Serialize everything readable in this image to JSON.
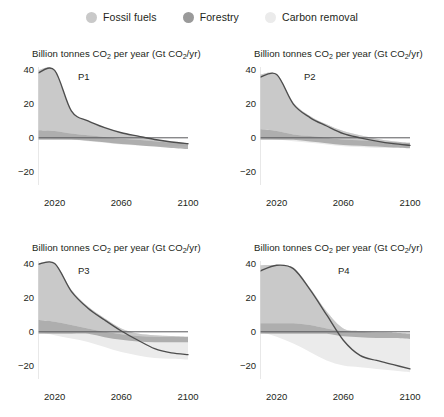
{
  "legend": {
    "items": [
      {
        "label": "Fossil fuels",
        "color": "#c9c9c9",
        "key": "fossil_fuels"
      },
      {
        "label": "Forestry",
        "color": "#9a9a9a",
        "key": "forestry"
      },
      {
        "label": "Carbon removal",
        "color": "#ebebeb",
        "key": "carbon_removal"
      }
    ]
  },
  "axis": {
    "y_ticks": [
      "40",
      "20",
      "0",
      "−20"
    ],
    "x_ticks": [
      "2020",
      "2060",
      "2100"
    ],
    "title": "Billion tonnes CO2 per year (Gt CO2/yr)",
    "title_prefix": "Billion tonnes CO",
    "title_mid": " per year (Gt CO",
    "title_suffix": "/yr)",
    "sub2": "2"
  },
  "colors": {
    "fossil_fuels": "#c9c9c9",
    "forestry": "#9a9a9a",
    "carbon_removal": "#ebebeb",
    "line": "#4d4d4d",
    "zero_line": "#58585a",
    "axis": "#d9d9d9",
    "text": "#231f20"
  },
  "chart_data": {
    "type": "area",
    "title": "Billion tonnes CO2 per year (Gt CO2/yr)",
    "xlabel": "",
    "ylabel": "Billion tonnes CO2 per year (Gt CO2/yr)",
    "xlim": [
      2010,
      2100
    ],
    "ylim": [
      -28,
      42
    ],
    "grid": false,
    "legend_position": "top-center",
    "x": [
      2010,
      2020,
      2030,
      2040,
      2050,
      2060,
      2070,
      2080,
      2090,
      2100
    ],
    "series_names": [
      "Fossil fuels",
      "Forestry",
      "Carbon removal",
      "Net CO2"
    ],
    "panels": [
      {
        "label": "P1",
        "net_emissions": [
          38.5,
          40.0,
          16.0,
          10.0,
          6.0,
          3.0,
          1.0,
          -1.0,
          -2.5,
          -3.5
        ],
        "fossil_fuels_band": [
          40.0,
          40.0,
          16.0,
          10.0,
          6.0,
          3.2,
          1.2,
          -0.8,
          -2.2,
          -3.2
        ],
        "forestry_band": [
          4.5,
          4.0,
          2.5,
          1.5,
          0.5,
          -0.5,
          -1.2,
          -2.0,
          -2.8,
          -3.5
        ],
        "carbon_removal_band": [
          0.0,
          -0.5,
          -1.0,
          -2.0,
          -3.0,
          -4.0,
          -4.5,
          -5.0,
          -5.0,
          -5.0
        ],
        "peak_year": 2020,
        "peak_value": 40.0,
        "value_2100": -3.5
      },
      {
        "label": "P2",
        "net_emissions": [
          36.0,
          37.5,
          20.0,
          12.0,
          7.0,
          2.5,
          0.0,
          -2.0,
          -3.5,
          -4.5
        ],
        "fossil_fuels_band": [
          37.5,
          37.5,
          21.0,
          13.0,
          8.0,
          4.0,
          1.5,
          -0.5,
          -2.0,
          -3.0
        ],
        "forestry_band": [
          5.0,
          4.0,
          2.0,
          1.0,
          0.0,
          -1.0,
          -1.5,
          -2.0,
          -2.5,
          -3.0
        ],
        "carbon_removal_band": [
          0.0,
          -1.0,
          -2.0,
          -3.0,
          -4.0,
          -5.0,
          -5.5,
          -6.0,
          -6.0,
          -6.0
        ],
        "peak_year": 2022,
        "peak_value": 37.5,
        "value_2100": -4.5
      },
      {
        "label": "P3",
        "net_emissions": [
          40.0,
          40.5,
          24.0,
          14.0,
          7.0,
          0.5,
          -5.0,
          -10.0,
          -12.5,
          -13.5
        ],
        "fossil_fuels_band": [
          40.5,
          40.5,
          25.0,
          15.0,
          8.0,
          2.0,
          -1.0,
          -2.0,
          -2.5,
          -3.0
        ],
        "forestry_band": [
          7.0,
          6.0,
          4.0,
          2.0,
          0.0,
          -1.5,
          -2.5,
          -3.0,
          -3.0,
          -3.0
        ],
        "carbon_removal_band": [
          0.0,
          -2.0,
          -4.0,
          -6.0,
          -9.0,
          -12.0,
          -14.0,
          -15.5,
          -16.0,
          -16.5
        ],
        "peak_year": 2022,
        "peak_value": 40.5,
        "value_2100": -13.5
      },
      {
        "label": "P4",
        "net_emissions": [
          36.0,
          39.5,
          37.5,
          25.0,
          10.0,
          -5.0,
          -14.0,
          -17.0,
          -19.5,
          -22.0
        ],
        "fossil_fuels_band": [
          39.5,
          39.5,
          38.0,
          26.0,
          12.0,
          2.0,
          0.5,
          0.0,
          -0.5,
          -1.0
        ],
        "forestry_band": [
          5.0,
          5.0,
          5.0,
          4.0,
          2.0,
          0.5,
          0.0,
          -0.5,
          -0.5,
          -1.0
        ],
        "carbon_removal_band": [
          0.0,
          -3.0,
          -7.0,
          -12.0,
          -17.0,
          -20.0,
          -21.0,
          -22.0,
          -23.0,
          -24.0
        ],
        "peak_year": 2025,
        "peak_value": 39.5,
        "value_2100": -22.0
      }
    ]
  }
}
